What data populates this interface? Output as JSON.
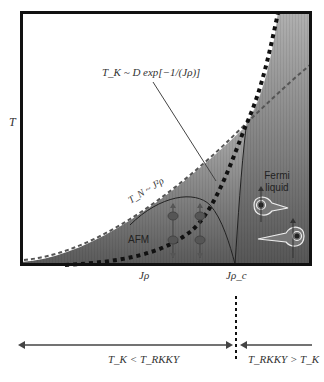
{
  "diagram": {
    "y_axis_label": "T",
    "x_ticks": [
      {
        "label": "Jρ"
      },
      {
        "label": "Jρ_c"
      }
    ],
    "annotations": {
      "kondo_formula": "T_K ~ D exp[−1/(Jρ)]",
      "neel_formula": "T_N ~ J²ρ",
      "afm_region": "AFM",
      "fermi_liquid_region_line1": "Fermi",
      "fermi_liquid_region_line2": "liquid"
    },
    "regimes": {
      "left": "T_K < T_RKKY",
      "right": "T_RKKY > T_K"
    },
    "colors": {
      "frame": "#111111",
      "fill_light": "#d8d8d8",
      "fill_dark": "#6a6a6a",
      "kondo_curve": "#111111",
      "rkky_curve": "#555555",
      "arrow": "#444444"
    }
  }
}
